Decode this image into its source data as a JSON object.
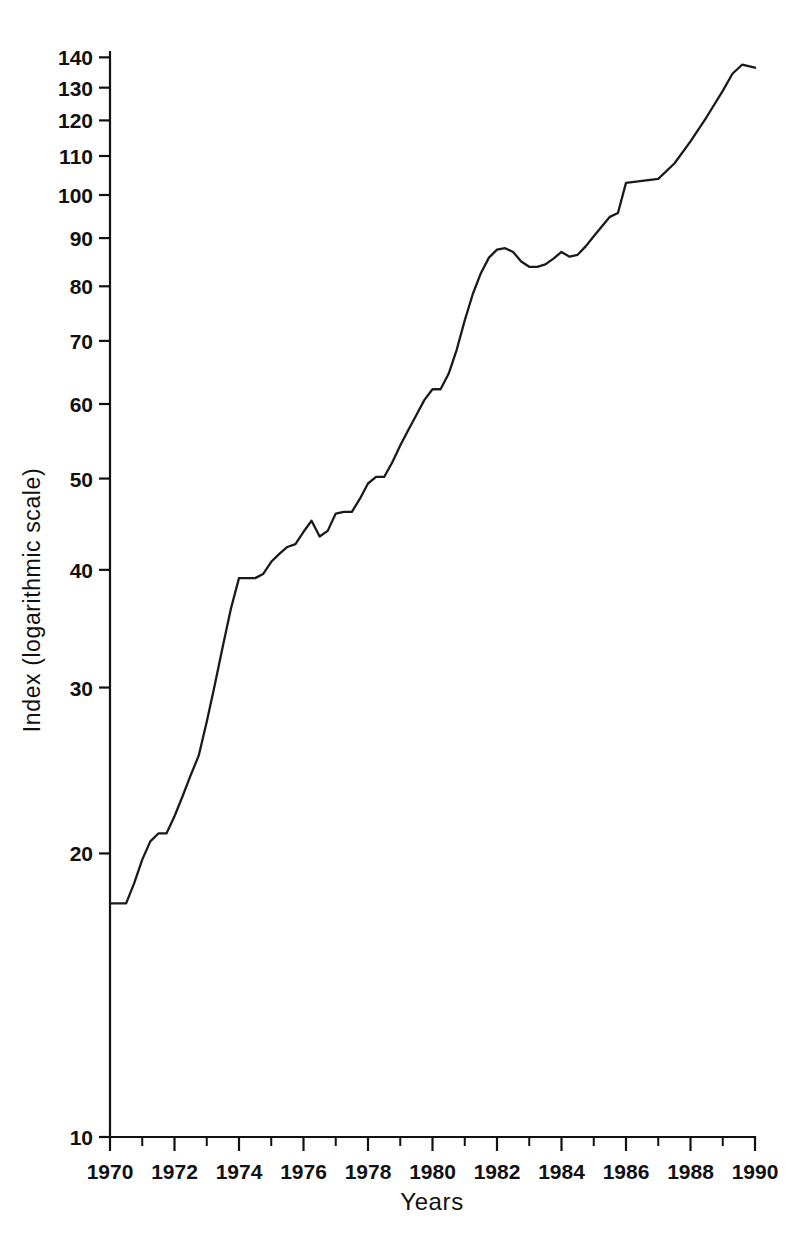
{
  "chart_data": {
    "type": "line",
    "title": "",
    "xlabel": "Years",
    "ylabel": "Index (logarithmic scale)",
    "yscale": "log",
    "xlim": [
      1970,
      1990
    ],
    "ylim": [
      10,
      145
    ],
    "grid": false,
    "legend": null,
    "y_ticks": [
      10,
      20,
      30,
      40,
      50,
      60,
      70,
      80,
      90,
      100,
      110,
      120,
      130,
      140
    ],
    "y_tick_labels": [
      "10",
      "20",
      "30",
      "40",
      "50",
      "60",
      "70",
      "80",
      "90",
      "100",
      "110",
      "120",
      "130",
      "140"
    ],
    "x_ticks": [
      1970,
      1972,
      1974,
      1976,
      1978,
      1980,
      1982,
      1984,
      1986,
      1988,
      1990
    ],
    "x_tick_labels": [
      "1970",
      "1972",
      "1974",
      "1976",
      "1978",
      "1980",
      "1982",
      "1984",
      "1986",
      "1988",
      "1990"
    ],
    "x_minor_ticks": [
      1971,
      1973,
      1975,
      1977,
      1979,
      1981,
      1983,
      1985,
      1987,
      1989
    ],
    "series": [
      {
        "name": "Index",
        "color": "#1a1a1a",
        "x": [
          1970.0,
          1970.25,
          1970.5,
          1970.75,
          1971.0,
          1971.25,
          1971.5,
          1971.75,
          1972.0,
          1972.25,
          1972.5,
          1972.75,
          1973.0,
          1973.25,
          1973.5,
          1973.75,
          1974.0,
          1974.25,
          1974.5,
          1974.75,
          1975.0,
          1975.25,
          1975.5,
          1975.75,
          1976.0,
          1976.25,
          1976.5,
          1976.75,
          1977.0,
          1977.25,
          1977.5,
          1977.75,
          1978.0,
          1978.25,
          1978.5,
          1978.75,
          1979.0,
          1979.25,
          1979.5,
          1979.75,
          1980.0,
          1980.25,
          1980.5,
          1980.75,
          1981.0,
          1981.25,
          1981.5,
          1981.75,
          1982.0,
          1982.25,
          1982.5,
          1982.75,
          1983.0,
          1983.25,
          1983.5,
          1983.75,
          1984.0,
          1984.25,
          1984.5,
          1984.75,
          1985.0,
          1985.25,
          1985.5,
          1985.75,
          1986.0,
          1986.25,
          1986.5,
          1986.75,
          1987.0,
          1987.25,
          1987.5,
          1987.75,
          1988.0,
          1988.25,
          1988.5,
          1988.75,
          1989.0,
          1989.25,
          1989.5,
          1989.75,
          1990.0
        ],
        "y": [
          17.7,
          17.7,
          17.7,
          18.6,
          19.7,
          20.6,
          21.0,
          21.0,
          21.9,
          23.0,
          24.2,
          25.4,
          27.6,
          30.2,
          33.2,
          36.4,
          39.2,
          39.2,
          39.2,
          39.6,
          40.8,
          41.6,
          42.3,
          42.6,
          43.9,
          45.1,
          43.4,
          44.0,
          45.9,
          46.1,
          46.1,
          47.6,
          49.4,
          50.2,
          50.2,
          52.0,
          54.2,
          56.3,
          58.4,
          60.6,
          62.2,
          62.2,
          64.6,
          68.5,
          73.6,
          78.5,
          82.6,
          85.8,
          87.5,
          87.8,
          87.0,
          85.0,
          83.9,
          83.9,
          84.4,
          85.6,
          87.0,
          86.0,
          86.4,
          88.2,
          90.4,
          92.6,
          94.8,
          95.7,
          95.0,
          95.6,
          96.8,
          97.3,
          97.9,
          99.3,
          101.6,
          103.8,
          103.3,
          102.9,
          105.8,
          110.2,
          113.6,
          116.4,
          119.3,
          123.2,
          126.0
        ]
      },
      {
        "name": "Index continued",
        "color": "#1a1a1a",
        "x": [
          1990.0
        ],
        "y": [
          126.0
        ]
      }
    ],
    "series_tail": {
      "x": [
        1986.0,
        1986.5,
        1987.0,
        1987.5,
        1988.0,
        1988.5,
        1989.0,
        1989.3,
        1989.6,
        1990.0
      ],
      "y": [
        103.0,
        103.5,
        104.0,
        108.0,
        114.0,
        121.0,
        129.0,
        134.5,
        137.5,
        136.5
      ]
    },
    "notes": {
      "start_value": "17.7",
      "end_value": "136.5",
      "peak_1981": "88",
      "trough_1982": "84"
    }
  },
  "axis_geometry": {
    "x0": 110,
    "x1": 755,
    "y_bottom": 1137,
    "y_top": 52,
    "log_min": 10,
    "log_decade_px": 942
  },
  "labels": {
    "x_axis_title": "Years",
    "y_axis_title": "Index (logarithmic scale)"
  }
}
